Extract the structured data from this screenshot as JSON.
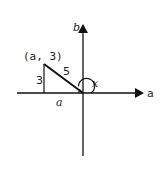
{
  "diagram": {
    "axes": {
      "horizontal_label": "a",
      "vertical_label": "b"
    },
    "triangle": {
      "vertex_label": "(a, 3)",
      "vertical_leg_label": "3",
      "hypotenuse_label": "5",
      "horizontal_leg_label": "a"
    },
    "angle_label": "x",
    "colors": {
      "stroke": "#111111",
      "background": "#ffffff"
    }
  }
}
